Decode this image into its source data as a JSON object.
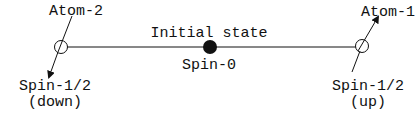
{
  "diagram": {
    "title": "Initial state",
    "center_particle": {
      "label": "Spin-0"
    },
    "atom_left": {
      "name": "Atom-2",
      "spin_label": "Spin-1/2",
      "spin_direction": "(down)"
    },
    "atom_right": {
      "name": "Atom-1",
      "spin_label": "Spin-1/2",
      "spin_direction": "(up)"
    },
    "colors": {
      "stroke": "#111111",
      "background": "#ffffff"
    }
  }
}
